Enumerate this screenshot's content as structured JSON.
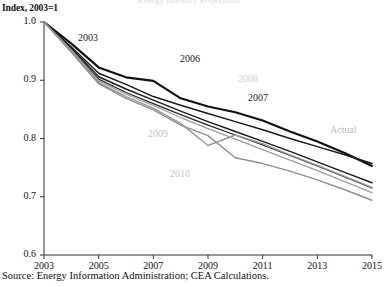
{
  "figure": {
    "top_trimmed_title": "Energy Intensity Projections",
    "axis_title": "Index, 2003=1",
    "source": "Source: Energy Information Administration; CEA Calculations."
  },
  "chart_data": {
    "type": "line",
    "title": "",
    "xlabel": "",
    "ylabel": "Index, 2003=1",
    "xlim": [
      2003,
      2015
    ],
    "ylim": [
      0.6,
      1.0
    ],
    "xticks": [
      "2003",
      "2005",
      "2007",
      "2009",
      "2011",
      "2013",
      "2015"
    ],
    "yticks": [
      "0.6",
      "0.7",
      "0.8",
      "0.9",
      "1.0"
    ],
    "grid": false,
    "legend": "inline-annotations",
    "x": [
      2003,
      2004,
      2005,
      2006,
      2007,
      2008,
      2009,
      2010,
      2011,
      2012,
      2013,
      2014,
      2015
    ],
    "series": [
      {
        "name": "Actual",
        "color": "#111111",
        "width": 2.2,
        "label": "Actual",
        "label_color": "#bdbdbd",
        "values": [
          1.0,
          0.963,
          0.922,
          0.905,
          0.899,
          0.869,
          0.855,
          0.845,
          0.831,
          0.812,
          0.795,
          0.775,
          0.753
        ]
      },
      {
        "name": "2003",
        "color": "#1a1a1a",
        "width": 1.5,
        "label": "2003",
        "label_color": "#1a1a1a",
        "values": [
          1.0,
          0.957,
          0.912,
          0.893,
          0.872,
          0.857,
          0.843,
          0.829,
          0.815,
          0.8,
          0.786,
          0.772,
          0.757
        ]
      },
      {
        "name": "2006",
        "color": "#1a1a1a",
        "width": 1.4,
        "label": "2006",
        "label_color": "#1a1a1a",
        "values": [
          1.0,
          0.955,
          0.906,
          0.885,
          0.866,
          0.847,
          0.829,
          0.812,
          0.795,
          0.778,
          0.76,
          0.742,
          0.724
        ]
      },
      {
        "name": "2007",
        "color": "#2a2a2a",
        "width": 1.3,
        "label": "2007",
        "label_color": "#2a2a2a",
        "values": [
          1.0,
          0.953,
          0.902,
          0.879,
          0.86,
          0.841,
          0.823,
          0.806,
          0.789,
          0.771,
          0.753,
          0.734,
          0.715
        ]
      },
      {
        "name": "2008",
        "color": "#9e9e9e",
        "width": 1.3,
        "label": "2008",
        "label_color": "#cfcfcf",
        "values": [
          1.0,
          0.952,
          0.899,
          0.876,
          0.857,
          0.836,
          0.817,
          0.799,
          0.781,
          0.763,
          0.745,
          0.726,
          0.707
        ]
      },
      {
        "name": "2009",
        "color": "#9a9a9a",
        "width": 1.4,
        "label": "2009",
        "label_color": "#c4c4c4",
        "values": [
          1.0,
          0.95,
          0.896,
          0.872,
          0.852,
          0.826,
          0.788,
          0.806,
          0.791,
          0.772,
          0.754,
          0.735,
          0.716
        ]
      },
      {
        "name": "2010",
        "color": "#8f8f8f",
        "width": 1.4,
        "label": "2010",
        "label_color": "#c4c4c4",
        "values": [
          1.0,
          0.948,
          0.894,
          0.869,
          0.849,
          0.823,
          0.805,
          0.767,
          0.757,
          0.744,
          0.729,
          0.712,
          0.694
        ]
      }
    ]
  }
}
